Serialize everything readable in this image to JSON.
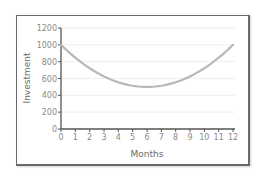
{
  "chart_data": {
    "type": "line",
    "title": "",
    "xlabel": "Months",
    "ylabel": "Investment",
    "x": [
      0,
      1,
      2,
      3,
      4,
      5,
      6,
      7,
      8,
      9,
      10,
      11,
      12
    ],
    "series": [
      {
        "name": "Investment",
        "values": [
          1000,
          861,
          750,
          667,
          611,
          583,
          500,
          583,
          611,
          667,
          750,
          861,
          1000
        ]
      }
    ],
    "curve_shape": "parabola with minimum 500 at month 6, 1000 at months 0 and 12",
    "xlim": [
      0,
      12
    ],
    "ylim": [
      0,
      1200
    ],
    "x_ticks": [
      "0",
      "1",
      "2",
      "3",
      "4",
      "5",
      "6",
      "7",
      "8",
      "9",
      "10",
      "11",
      "12"
    ],
    "y_ticks": [
      "0",
      "200",
      "400",
      "600",
      "800",
      "1000",
      "1200"
    ],
    "grid": "horizontal faint",
    "legend": null,
    "colors": {
      "line": "#b8b8b8",
      "axis": "#555555",
      "grid": "#eeeeee",
      "frame": "#6a6a6a",
      "text": "#8a8a8a"
    }
  }
}
